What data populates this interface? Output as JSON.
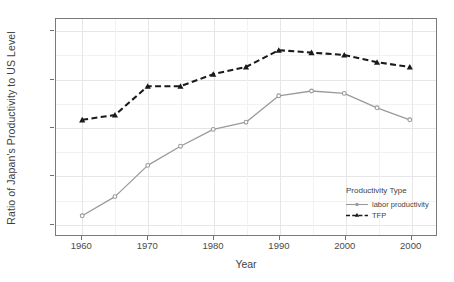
{
  "chart_data": {
    "type": "line",
    "title": "",
    "xlabel": "Year",
    "ylabel": "Ratio of Japan's Productivity to US Level",
    "x": [
      1960,
      1965,
      1970,
      1975,
      1980,
      1985,
      1990,
      1995,
      2000,
      2005,
      2010
    ],
    "xtick_labels": [
      "1960",
      "1970",
      "1980",
      "1990",
      "2000",
      "2000"
    ],
    "xtick_values": [
      1960,
      1970,
      1980,
      1990,
      2000,
      2010
    ],
    "ytick_labels": [
      "0.2",
      "0.4",
      "0.6",
      "0.8",
      "1.0"
    ],
    "ytick_values": [
      0.2,
      0.4,
      0.6,
      0.8,
      1.0
    ],
    "xlim": [
      1956,
      2014
    ],
    "ylim": [
      0.15,
      1.05
    ],
    "grid": true,
    "legend_position": "bottom-right",
    "legend_title": "Productivity Type",
    "series": [
      {
        "name": "labor productivity",
        "color": "#9a9a9a",
        "line_style": "solid",
        "marker": "circle",
        "values": [
          0.23,
          0.31,
          0.44,
          0.52,
          0.59,
          0.62,
          0.73,
          0.75,
          0.74,
          0.68,
          0.63
        ]
      },
      {
        "name": "TFP",
        "color": "#1a1a1a",
        "line_style": "dashed",
        "marker": "triangle",
        "values": [
          0.63,
          0.65,
          0.77,
          0.77,
          0.82,
          0.85,
          0.92,
          0.91,
          0.9,
          0.87,
          0.85
        ]
      }
    ]
  },
  "axis": {
    "y_title": "Ratio of Japan's Productivity to US Level",
    "x_title": "Year"
  },
  "legend": {
    "title": "Productivity Type",
    "items": [
      {
        "label": "labor productivity"
      },
      {
        "label": "TFP"
      }
    ]
  },
  "colors": {
    "labor": "#9a9a9a",
    "tfp": "#1a1a1a",
    "grid": "#e6e6e6",
    "panel_border": "#7a7a7a",
    "background": "#ffffff"
  }
}
